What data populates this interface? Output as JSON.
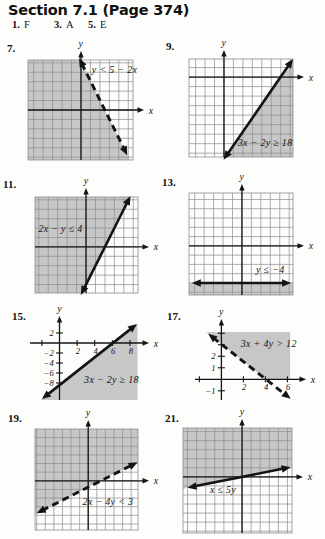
{
  "page": {
    "title": "Section 7.1 (Page 374)",
    "answers": [
      {
        "number": "1.",
        "letter": "F"
      },
      {
        "number": "3.",
        "letter": "A"
      },
      {
        "number": "5.",
        "letter": "E"
      }
    ]
  },
  "colors": {
    "shade": "#c7c7c7",
    "grid_line": "#8d8d8d",
    "ink": "#141414",
    "paper": "#fdfdfb"
  },
  "chart_data": [
    {
      "problem": "7.",
      "type": "linear-inequality",
      "inequality": "y < 5 − 2x",
      "boundary": {
        "style": "dashed",
        "from": [
          -0.2,
          5.5
        ],
        "to": [
          4.9,
          -4.8
        ],
        "arrows": [
          "start",
          "end"
        ]
      },
      "shade": [
        [
          -5.6,
          5.3
        ],
        [
          -0.1,
          5.3
        ],
        [
          5.15,
          -5.31
        ],
        [
          -5.6,
          -5.31
        ]
      ],
      "grid": true,
      "x_range": [
        -5.6,
        5.5
      ],
      "y_range": [
        -5.3,
        5.3
      ],
      "x_ticks": [],
      "y_ticks": [],
      "label_pos": [
        3.55,
        4.25
      ],
      "axis_labels": {
        "x": "x",
        "y": "y"
      },
      "layout": {
        "size": [
          152,
          126
        ],
        "plot": [
          10,
          20,
          105,
          100
        ]
      }
    },
    {
      "problem": "9.",
      "type": "linear-inequality",
      "inequality": "3x − 2y ≥ 18",
      "boundary": {
        "style": "solid",
        "from": [
          -0.05,
          -8.7
        ],
        "to": [
          7.3,
          1.9
        ],
        "arrows": [
          "start",
          "end"
        ]
      },
      "shade": [
        [
          0.14,
          -8.42
        ],
        [
          7.3,
          -8.42
        ],
        [
          7.3,
          1.9
        ]
      ],
      "grid": true,
      "x_range": [
        -3.7,
        7.3
      ],
      "y_range": [
        -8.4,
        1.9
      ],
      "x_ticks": [],
      "y_ticks": [],
      "label_pos": [
        4.35,
        -6.85
      ],
      "axis_labels": {
        "x": "x",
        "y": "y"
      },
      "layout": {
        "size": [
          167,
          126
        ],
        "plot": [
          31,
          23,
          104,
          98
        ]
      }
    },
    {
      "problem": "11.",
      "type": "linear-inequality",
      "inequality": "2x − y ≤ 4",
      "boundary": {
        "style": "solid",
        "from": [
          -0.55,
          -5.1
        ],
        "to": [
          4.7,
          5.4
        ],
        "arrows": [
          "start",
          "end"
        ]
      },
      "shade": [
        [
          -5.4,
          5.3
        ],
        [
          4.65,
          5.3
        ],
        [
          -0.45,
          -4.9
        ],
        [
          -5.4,
          -4.9
        ]
      ],
      "grid": true,
      "x_range": [
        -5.4,
        5.5
      ],
      "y_range": [
        -4.9,
        5.3
      ],
      "x_ticks": [],
      "y_ticks": [],
      "label_pos": [
        -2.7,
        1.95
      ],
      "axis_labels": {
        "x": "x",
        "y": "y"
      },
      "layout": {
        "size": [
          152,
          124
        ],
        "plot": [
          17,
          22,
          103,
          96
        ]
      }
    },
    {
      "problem": "13.",
      "type": "linear-inequality",
      "inequality": "y ≤ −4",
      "boundary": {
        "style": "solid",
        "from": [
          -5.3,
          -4
        ],
        "to": [
          5.2,
          -4
        ],
        "arrows": [
          "start",
          "end"
        ]
      },
      "shade": [
        [
          -5.6,
          -4
        ],
        [
          5.4,
          -4
        ],
        [
          5.4,
          -5.3
        ],
        [
          -5.6,
          -5.3
        ]
      ],
      "grid": true,
      "x_range": [
        -5.6,
        5.4
      ],
      "y_range": [
        -5.3,
        5.7
      ],
      "x_ticks": [],
      "y_ticks": [],
      "label_pos": [
        3.0,
        -2.5
      ],
      "axis_labels": {
        "x": "x",
        "y": "y"
      },
      "layout": {
        "size": [
          167,
          128
        ],
        "plot": [
          31,
          22,
          104,
          102
        ]
      }
    },
    {
      "problem": "15.",
      "type": "linear-inequality",
      "inequality": "3x − 2y ≥ 18",
      "boundary": {
        "style": "solid",
        "from": [
          -2.0,
          -11.2
        ],
        "to": [
          8.8,
          3.8
        ],
        "arrows": [
          "start",
          "end"
        ]
      },
      "shade": [
        [
          -2.14,
          -11.4
        ],
        [
          8.85,
          -11.4
        ],
        [
          8.85,
          3.87
        ]
      ],
      "grid": false,
      "x_range": [
        -3.35,
        10.05
      ],
      "y_range": [
        -11.4,
        5.2
      ],
      "x_ticks": [
        {
          "v": -2,
          "label": ""
        },
        {
          "v": 2,
          "label": "2"
        },
        {
          "v": 4,
          "label": "4"
        },
        {
          "v": 6,
          "label": "6"
        },
        {
          "v": 8,
          "label": "8"
        }
      ],
      "y_ticks": [
        {
          "v": 2,
          "label": "2"
        },
        {
          "v": -2,
          "label": "−2"
        },
        {
          "v": -4,
          "label": "−4"
        },
        {
          "v": -6,
          "label": "−6"
        },
        {
          "v": -8,
          "label": "−8"
        }
      ],
      "label_pos": [
        5.9,
        -7.3
      ],
      "axis_labels": {
        "x": "x",
        "y": "y"
      },
      "layout": {
        "size": [
          157,
          111
        ],
        "plot": [
          22,
          21,
          118,
          83
        ]
      }
    },
    {
      "problem": "17.",
      "type": "linear-inequality",
      "inequality": "3x + 4y > 12",
      "boundary": {
        "style": "dashed",
        "from": [
          -1.2,
          3.95
        ],
        "to": [
          6.3,
          -1.7
        ],
        "arrows": [
          "start",
          "end"
        ]
      },
      "shade": [
        [
          -1.4,
          4.1
        ],
        [
          6.25,
          4.1
        ],
        [
          6.25,
          0
        ],
        [
          4.04,
          0
        ]
      ],
      "grid": false,
      "x_range": [
        -2.4,
        7.6
      ],
      "y_range": [
        -1.8,
        5.15
      ],
      "x_ticks": [
        {
          "v": -2,
          "label": ""
        },
        {
          "v": 2,
          "label": "2"
        },
        {
          "v": 4,
          "label": "4"
        },
        {
          "v": 6,
          "label": "6"
        }
      ],
      "y_ticks": [
        {
          "v": 1,
          "label": "1"
        },
        {
          "v": 2,
          "label": "2"
        },
        {
          "v": 3,
          "label": ""
        },
        {
          "v": 4,
          "label": ""
        },
        {
          "v": -1,
          "label": "−1"
        }
      ],
      "label_pos": [
        4.3,
        3.1
      ],
      "axis_labels": {
        "x": "x",
        "y": "y"
      },
      "layout": {
        "size": [
          162,
          111
        ],
        "plot": [
          32,
          24,
          110,
          80
        ]
      }
    },
    {
      "problem": "19.",
      "type": "linear-inequality",
      "inequality": "2x − 4y < 3",
      "boundary": {
        "style": "dashed",
        "from": [
          -6.0,
          -3.75
        ],
        "to": [
          5.75,
          2.15
        ],
        "arrows": [
          "start",
          "end"
        ]
      },
      "shade": [
        [
          -6.2,
          -3.85
        ],
        [
          -6.2,
          6.0
        ],
        [
          5.8,
          6.0
        ],
        [
          5.8,
          2.18
        ]
      ],
      "grid": true,
      "x_range": [
        -6.2,
        5.8
      ],
      "y_range": [
        -5.7,
        6.0
      ],
      "x_ticks": [],
      "y_ticks": [],
      "label_pos": [
        2.3,
        -2.45
      ],
      "axis_labels": {
        "x": "x",
        "y": "y"
      },
      "layout": {
        "size": [
          152,
          130
        ],
        "plot": [
          17,
          21,
          103,
          101
        ]
      }
    },
    {
      "problem": "21.",
      "type": "linear-inequality",
      "inequality": "x ≤ 5y",
      "boundary": {
        "style": "solid",
        "from": [
          -6.0,
          -1.2
        ],
        "to": [
          5.35,
          1.07
        ],
        "arrows": [
          "start",
          "end"
        ]
      },
      "shade": [
        [
          -6.5,
          -1.3
        ],
        [
          -6.5,
          5.4
        ],
        [
          5.5,
          5.4
        ],
        [
          5.5,
          1.1
        ]
      ],
      "grid": true,
      "x_range": [
        -6.5,
        5.5
      ],
      "y_range": [
        -6.2,
        5.4
      ],
      "x_ticks": [],
      "y_ticks": [],
      "label_pos": [
        -2.1,
        -1.4
      ],
      "axis_labels": {
        "x": "x",
        "y": "y"
      },
      "layout": {
        "size": [
          167,
          131
        ],
        "plot": [
          25,
          20,
          109,
          105
        ]
      }
    }
  ]
}
